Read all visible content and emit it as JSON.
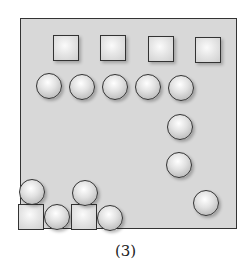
{
  "figure": {
    "label": "(3)",
    "frame_color": "#d8d8d8",
    "shapes": {
      "top_squares": 4,
      "top_circles_row": 5,
      "right_column_circles": 3,
      "bottom_squares": 2,
      "bottom_circles": 4
    }
  }
}
